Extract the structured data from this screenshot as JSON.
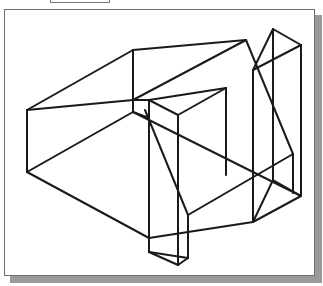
{
  "figure": {
    "type": "isometric wireframe drawing",
    "stroke_color": "#1a1a1a",
    "stroke_width": 2,
    "frame_border_color": "#6e6e6e",
    "shadow_color": "#9a9a9a"
  },
  "edges": [
    [
      27,
      110,
      133,
      50
    ],
    [
      133,
      50,
      246,
      40
    ],
    [
      27,
      110,
      133,
      100
    ],
    [
      133,
      100,
      246,
      40
    ],
    [
      27,
      110,
      27,
      172
    ],
    [
      133,
      50,
      133,
      112
    ],
    [
      27,
      172,
      133,
      112
    ],
    [
      27,
      172,
      149,
      238
    ],
    [
      133,
      100,
      149,
      100
    ],
    [
      133,
      112,
      149,
      118
    ],
    [
      149,
      100,
      226,
      88
    ],
    [
      149,
      100,
      178,
      115
    ],
    [
      178,
      115,
      226,
      88
    ],
    [
      149,
      100,
      149,
      252
    ],
    [
      178,
      115,
      178,
      265
    ],
    [
      226,
      88,
      226,
      175
    ],
    [
      149,
      252,
      178,
      265
    ],
    [
      178,
      265,
      188,
      258
    ],
    [
      188,
      258,
      188,
      215
    ],
    [
      145,
      110,
      188,
      215
    ],
    [
      188,
      215,
      293,
      154
    ],
    [
      149,
      238,
      253,
      222
    ],
    [
      133,
      112,
      301,
      196
    ],
    [
      273,
      29,
      301,
      45
    ],
    [
      273,
      29,
      253,
      70
    ],
    [
      253,
      70,
      301,
      45
    ],
    [
      273,
      29,
      273,
      180
    ],
    [
      253,
      70,
      253,
      222
    ],
    [
      301,
      45,
      301,
      196
    ],
    [
      246,
      40,
      293,
      154
    ],
    [
      293,
      154,
      293,
      193
    ],
    [
      253,
      222,
      301,
      196
    ],
    [
      273,
      180,
      301,
      196
    ],
    [
      273,
      180,
      253,
      222
    ],
    [
      149,
      252,
      188,
      258
    ]
  ]
}
